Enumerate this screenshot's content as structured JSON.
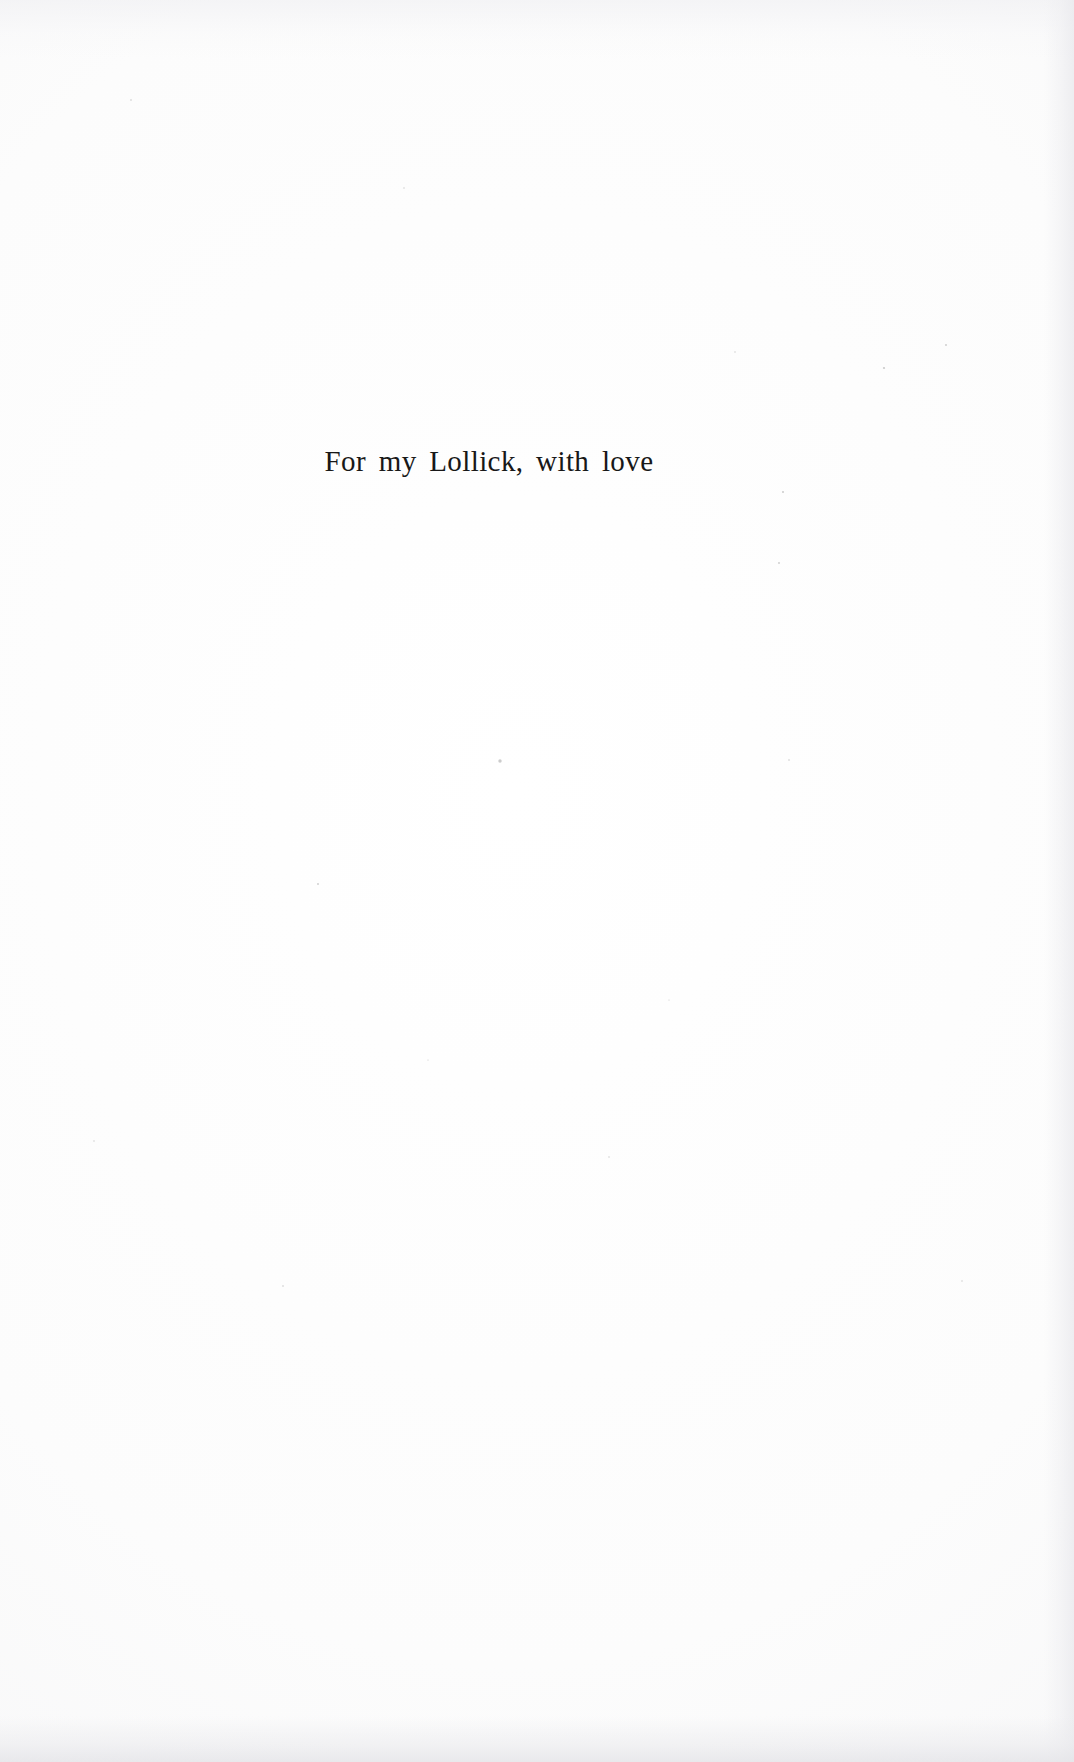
{
  "page": {
    "kind": "book-dedication-page",
    "background_color": "#fdfdfd",
    "ink_color": "#181818",
    "width": 1074,
    "height": 1762
  },
  "dedication": {
    "text": "For my Lollick, with love"
  }
}
